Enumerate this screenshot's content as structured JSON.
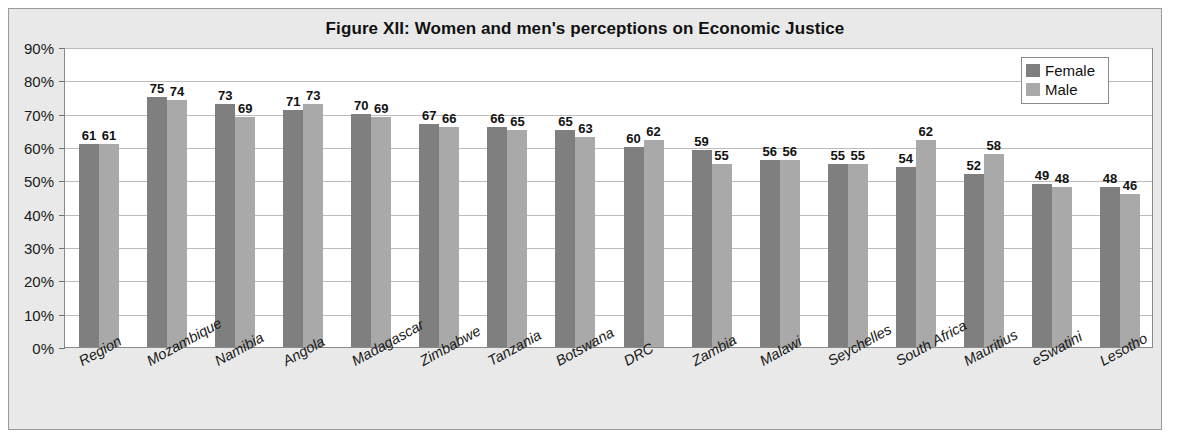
{
  "chart_data": {
    "type": "bar",
    "title": "Figure XII: Women and men's perceptions on Economic Justice",
    "xlabel": "",
    "ylabel": "",
    "ylim": [
      0,
      90
    ],
    "ytick_labels": [
      "90%",
      "80%",
      "70%",
      "60%",
      "50%",
      "40%",
      "30%",
      "20%",
      "10%",
      "0%"
    ],
    "ytick_values": [
      90,
      80,
      70,
      60,
      50,
      40,
      30,
      20,
      10,
      0
    ],
    "grid": true,
    "legend_position": "top-right",
    "categories": [
      "Region",
      "Mozambique",
      "Namibia",
      "Angola",
      "Madagascar",
      "Zimbabwe",
      "Tanzania",
      "Botswana",
      "DRC",
      "Zambia",
      "Malawi",
      "Seychelles",
      "South Africa",
      "Mauritius",
      "eSwatini",
      "Lesotho"
    ],
    "series": [
      {
        "name": "Female",
        "color": "#7f7f7f",
        "values": [
          61,
          75,
          73,
          71,
          70,
          67,
          66,
          65,
          60,
          59,
          56,
          55,
          54,
          52,
          49,
          48
        ]
      },
      {
        "name": "Male",
        "color": "#a9a9a9",
        "values": [
          61,
          74,
          69,
          73,
          69,
          66,
          65,
          63,
          62,
          55,
          56,
          55,
          62,
          58,
          48,
          46
        ]
      }
    ]
  },
  "legend": {
    "items": [
      {
        "label": "Female"
      },
      {
        "label": "Male"
      }
    ]
  }
}
